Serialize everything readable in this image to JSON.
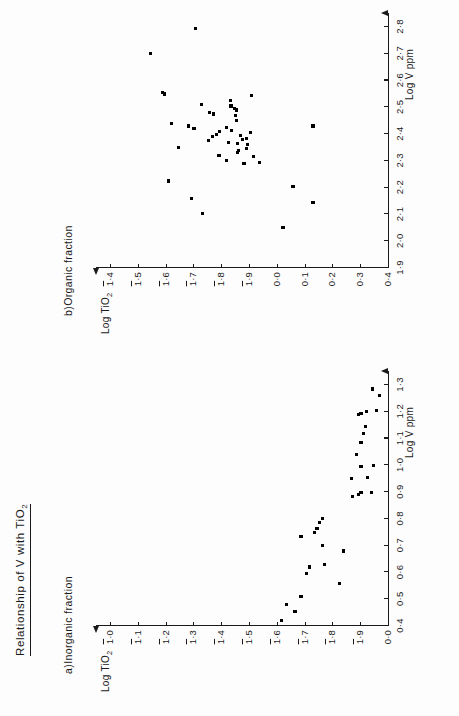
{
  "figure": {
    "title": "Relationship of V with TiO",
    "title_sub": "2",
    "orientation": "page rotated 90 degrees counter-clockwise"
  },
  "chart_data": [
    {
      "type": "scatter",
      "panel_id": "a",
      "title": "a)Inorganic fraction",
      "xlabel": "Log V ppm",
      "ylabel": "Log TiO",
      "ylabel_sub": "2",
      "xlim": [
        0.4,
        1.3
      ],
      "xticks": [
        "0·4",
        "0·5",
        "0·6",
        "0·7",
        "0·8",
        "0·9",
        "1·0",
        "1·1",
        "1·2",
        "1·3"
      ],
      "xtick_values": [
        0.4,
        0.5,
        0.6,
        0.7,
        0.8,
        0.9,
        1.0,
        1.1,
        1.2,
        1.3
      ],
      "ylim": [
        -2.0,
        0.0
      ],
      "yticks": [
        "0·0",
        "1·9",
        "1·8",
        "1·7",
        "1·6",
        "1·5",
        "1·4",
        "1·3",
        "1·2",
        "1·1",
        "1·0"
      ],
      "yticks_overbar": [
        false,
        true,
        true,
        true,
        true,
        true,
        true,
        true,
        true,
        true,
        true
      ],
      "ytick_values": [
        0.0,
        -1.9,
        -1.8,
        -1.7,
        -1.6,
        -1.5,
        -1.4,
        -1.3,
        -1.2,
        -1.1,
        -1.0
      ],
      "grid": false,
      "legend": "none",
      "points": [
        [
          1.285,
          -1.795
        ],
        [
          1.26,
          -1.84
        ],
        [
          1.205,
          -1.82
        ],
        [
          1.2,
          -1.755
        ],
        [
          1.195,
          -1.715
        ],
        [
          1.19,
          -1.7
        ],
        [
          1.145,
          -1.745
        ],
        [
          1.12,
          -1.735
        ],
        [
          1.085,
          -1.715
        ],
        [
          1.04,
          -1.685
        ],
        [
          1.0,
          -1.8
        ],
        [
          0.995,
          -1.715
        ],
        [
          0.955,
          -1.76
        ],
        [
          0.95,
          -1.65
        ],
        [
          0.9,
          -1.79
        ],
        [
          0.9,
          -1.715
        ],
        [
          0.89,
          -1.7
        ],
        [
          0.885,
          -1.66
        ],
        [
          0.8,
          -1.455
        ],
        [
          0.785,
          -1.43
        ],
        [
          0.765,
          -1.415
        ],
        [
          0.75,
          -1.395
        ],
        [
          0.735,
          -1.305
        ],
        [
          0.7,
          -1.45
        ],
        [
          0.68,
          -1.595
        ],
        [
          0.63,
          -1.465
        ],
        [
          0.62,
          -1.365
        ],
        [
          0.595,
          -1.345
        ],
        [
          0.56,
          -1.57
        ],
        [
          0.51,
          -1.305
        ],
        [
          0.48,
          -1.205
        ],
        [
          0.455,
          -1.265
        ],
        [
          0.42,
          -1.17
        ]
      ]
    },
    {
      "type": "scatter",
      "panel_id": "b",
      "title": "b)Organic  fraction",
      "xlabel": "Log V ppm",
      "ylabel": "Log TiO",
      "ylabel_sub": "2",
      "xlim": [
        1.9,
        2.8
      ],
      "xticks": [
        "1·9",
        "2·0",
        "2·1",
        "2·2",
        "2·3",
        "2·4",
        "2·5",
        "2·6",
        "2·7",
        "2·8"
      ],
      "xtick_values": [
        1.9,
        2.0,
        2.1,
        2.2,
        2.3,
        2.4,
        2.5,
        2.6,
        2.7,
        2.8
      ],
      "ylim": [
        -1.4,
        0.4
      ],
      "yticks": [
        "0·4",
        "0·3",
        "0·2",
        "0·1",
        "0·0",
        "1·9",
        "1·8",
        "1·7",
        "1·6",
        "1·5",
        "1·4"
      ],
      "yticks_overbar": [
        false,
        false,
        false,
        false,
        false,
        true,
        true,
        true,
        true,
        true,
        true
      ],
      "ytick_values": [
        0.4,
        0.3,
        0.2,
        0.1,
        0.0,
        -0.1,
        -0.2,
        -0.3,
        -0.4,
        -0.5,
        -0.6
      ],
      "grid": false,
      "legend": "none",
      "points": [
        [
          2.795,
          0.093
        ],
        [
          2.7,
          0.255
        ],
        [
          2.555,
          0.212
        ],
        [
          2.55,
          0.205
        ],
        [
          2.545,
          -0.108
        ],
        [
          2.525,
          -0.032
        ],
        [
          2.51,
          0.072
        ],
        [
          2.505,
          -0.035
        ],
        [
          2.495,
          -0.048
        ],
        [
          2.49,
          -0.055
        ],
        [
          2.48,
          0.042
        ],
        [
          2.475,
          0.028
        ],
        [
          2.47,
          -0.05
        ],
        [
          2.45,
          -0.055
        ],
        [
          2.44,
          0.18
        ],
        [
          2.43,
          0.118
        ],
        [
          2.425,
          -0.02
        ],
        [
          2.42,
          0.098
        ],
        [
          2.415,
          -0.038
        ],
        [
          2.41,
          0.005
        ],
        [
          2.405,
          -0.105
        ],
        [
          2.4,
          0.018
        ],
        [
          2.395,
          -0.068
        ],
        [
          2.39,
          0.03
        ],
        [
          2.385,
          -0.092
        ],
        [
          2.38,
          -0.078
        ],
        [
          2.375,
          0.045
        ],
        [
          2.37,
          -0.025
        ],
        [
          2.365,
          -0.06
        ],
        [
          2.36,
          -0.095
        ],
        [
          2.35,
          0.155
        ],
        [
          2.345,
          -0.09
        ],
        [
          2.34,
          -0.062
        ],
        [
          2.33,
          -0.058
        ],
        [
          2.32,
          0.008
        ],
        [
          2.315,
          -0.115
        ],
        [
          2.3,
          -0.018
        ],
        [
          2.295,
          -0.138
        ],
        [
          2.29,
          -0.082
        ],
        [
          2.225,
          0.19
        ],
        [
          2.205,
          -0.258
        ],
        [
          2.16,
          0.108
        ],
        [
          2.145,
          -0.33
        ],
        [
          2.105,
          0.068
        ],
        [
          2.05,
          -0.222
        ],
        [
          2.43,
          -0.33
        ]
      ]
    }
  ]
}
